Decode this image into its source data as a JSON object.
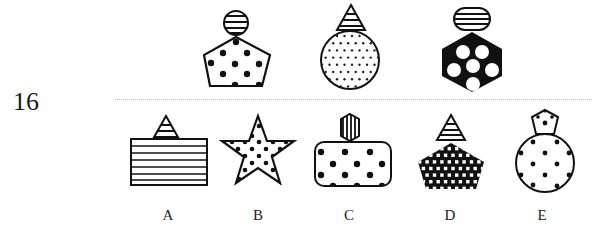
{
  "question": {
    "number": "16",
    "type": "figure-sequence-puzzle"
  },
  "sequence": [
    {
      "container": "circle",
      "container_fill": "horizontal-stripes",
      "body": "pentagon",
      "body_fill": "large-black-dots-on-white"
    },
    {
      "container": "triangle",
      "container_fill": "horizontal-stripes",
      "body": "circle",
      "body_fill": "small-dots-on-white"
    },
    {
      "container": "rounded-capsule",
      "container_fill": "horizontal-stripes",
      "body": "hexagon",
      "body_fill": "white-circles-on-black"
    }
  ],
  "options": [
    {
      "label": "A",
      "container": "triangle",
      "container_fill": "horizontal-stripes",
      "body": "rectangle",
      "body_fill": "horizontal-stripes"
    },
    {
      "label": "B",
      "container": "none",
      "container_fill": "none",
      "body": "star",
      "body_fill": "black-dots-on-white"
    },
    {
      "label": "C",
      "container": "hexagon",
      "container_fill": "vertical-stripes",
      "body": "rounded-rectangle",
      "body_fill": "large-black-dots-on-white"
    },
    {
      "label": "D",
      "container": "triangle",
      "container_fill": "horizontal-stripes",
      "body": "pentagon",
      "body_fill": "white-squares-on-black"
    },
    {
      "label": "E",
      "container": "pentagon",
      "container_fill": "single-dot",
      "body": "circle",
      "body_fill": "black-dots-on-white"
    }
  ],
  "colors": {
    "ink": "#111111",
    "paper": "#ffffff",
    "separator": "#b9b9b9"
  }
}
